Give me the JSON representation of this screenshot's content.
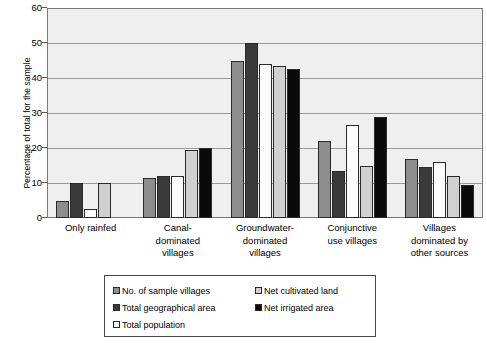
{
  "chart_data": {
    "type": "bar",
    "title": "",
    "subtitle": "",
    "xlabel": "",
    "ylabel": "Percentage of total for the sample",
    "ylim": [
      0,
      60
    ],
    "yticks": [
      0,
      10,
      20,
      30,
      40,
      50,
      60
    ],
    "grid": true,
    "grid_axis": "y",
    "legend_position": "bottom",
    "legend_columns": 2,
    "categories": [
      "Only rainfed",
      "Canal-dominated villages",
      "Groundwater-dominated villages",
      "Conjunctive use villages",
      "Villages dominated by other sources"
    ],
    "category_label_lines": [
      [
        "Only rainfed"
      ],
      [
        "Canal-",
        "dominated",
        "villages"
      ],
      [
        "Groundwater-",
        "dominated",
        "villages"
      ],
      [
        "Conjunctive",
        "use villages"
      ],
      [
        "Villages",
        "dominated by",
        "other sources"
      ]
    ],
    "series": [
      {
        "name": "No. of sample villages",
        "color": "#8d8d8d",
        "values": [
          5.0,
          11.5,
          45.0,
          22.0,
          17.0
        ]
      },
      {
        "name": "Total geographical area",
        "color": "#3a3a3a",
        "values": [
          10.0,
          12.0,
          50.0,
          13.5,
          14.5
        ]
      },
      {
        "name": "Total population",
        "color": "#fbfbfb",
        "values": [
          2.5,
          12.0,
          44.0,
          26.5,
          16.0
        ]
      },
      {
        "name": "Net cultivated land",
        "color": "#d0d0d0",
        "values": [
          10.0,
          19.5,
          43.5,
          15.0,
          12.0
        ]
      },
      {
        "name": "Net irrigated area",
        "color": "#0a0a0a",
        "values": [
          0.0,
          20.0,
          42.5,
          29.0,
          9.5
        ]
      }
    ]
  },
  "legend": {
    "entries": [
      {
        "label": "No. of sample villages",
        "swatch": "#8d8d8d"
      },
      {
        "label": "Net cultivated land",
        "swatch": "#d0d0d0"
      },
      {
        "label": "Total geographical area",
        "swatch": "#3a3a3a"
      },
      {
        "label": "Net irrigated area",
        "swatch": "#0a0a0a"
      },
      {
        "label": "Total population",
        "swatch": "#fbfbfb"
      }
    ]
  }
}
